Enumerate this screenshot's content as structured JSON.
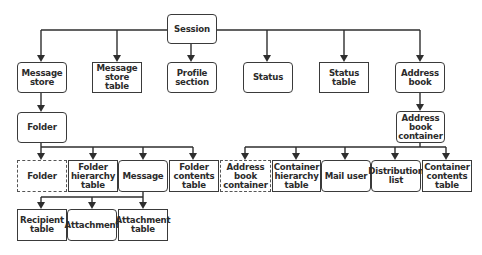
{
  "diagram": {
    "nodes": {
      "session": {
        "label": "Session",
        "shape": "rounded"
      },
      "message_store": {
        "label": "Message\nstore",
        "shape": "rounded"
      },
      "message_store_table": {
        "label": "Message\nstore table",
        "shape": "square"
      },
      "profile_section": {
        "label": "Profile\nsection",
        "shape": "rounded"
      },
      "status": {
        "label": "Status",
        "shape": "rounded"
      },
      "status_table": {
        "label": "Status table",
        "shape": "square"
      },
      "address_book": {
        "label": "Address\nbook",
        "shape": "rounded"
      },
      "folder": {
        "label": "Folder",
        "shape": "rounded"
      },
      "address_book_container": {
        "label": "Address\nbook\ncontainer",
        "shape": "rounded"
      },
      "subfolder": {
        "label": "Folder",
        "shape": "dashed"
      },
      "folder_hierarchy_table": {
        "label": "Folder\nhierarchy\ntable",
        "shape": "square"
      },
      "message": {
        "label": "Message",
        "shape": "rounded"
      },
      "folder_contents_table": {
        "label": "Folder\ncontents\ntable",
        "shape": "square"
      },
      "sub_address_book_container": {
        "label": "Address\nbook\ncontainer",
        "shape": "dashed"
      },
      "container_hierarchy_table": {
        "label": "Container\nhierarchy\ntable",
        "shape": "square"
      },
      "mail_user": {
        "label": "Mail user",
        "shape": "rounded"
      },
      "distribution_list": {
        "label": "Distribution\nlist",
        "shape": "rounded"
      },
      "container_contents_table": {
        "label": "Container\ncontents\ntable",
        "shape": "square"
      },
      "recipient_table": {
        "label": "Recipient\ntable",
        "shape": "square"
      },
      "attachment": {
        "label": "Attachment",
        "shape": "rounded"
      },
      "attachment_table": {
        "label": "Attachment\ntable",
        "shape": "square"
      }
    },
    "edges": [
      [
        "session",
        "message_store"
      ],
      [
        "session",
        "message_store_table"
      ],
      [
        "session",
        "profile_section"
      ],
      [
        "session",
        "status"
      ],
      [
        "session",
        "status_table"
      ],
      [
        "session",
        "address_book"
      ],
      [
        "message_store",
        "folder"
      ],
      [
        "address_book",
        "address_book_container"
      ],
      [
        "folder",
        "subfolder"
      ],
      [
        "folder",
        "folder_hierarchy_table"
      ],
      [
        "folder",
        "message"
      ],
      [
        "folder",
        "folder_contents_table"
      ],
      [
        "address_book_container",
        "sub_address_book_container"
      ],
      [
        "address_book_container",
        "container_hierarchy_table"
      ],
      [
        "address_book_container",
        "mail_user"
      ],
      [
        "address_book_container",
        "distribution_list"
      ],
      [
        "address_book_container",
        "container_contents_table"
      ],
      [
        "message",
        "recipient_table"
      ],
      [
        "message",
        "attachment"
      ],
      [
        "message",
        "attachment_table"
      ]
    ],
    "colors": {
      "line": "#2e2e2e",
      "border": "#3a3a3a",
      "text": "#2b2b2b",
      "background": "#ffffff"
    }
  }
}
